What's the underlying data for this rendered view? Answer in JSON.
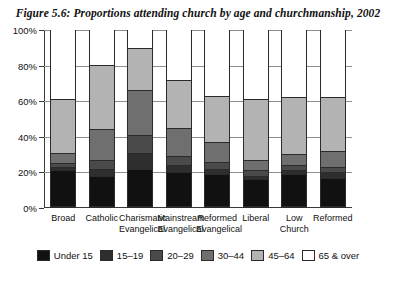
{
  "figure": {
    "title": "Figure 5.6: Proportions attending church by age and churchmanship, 2002"
  },
  "chart_data": {
    "type": "bar",
    "subtype": "stacked-bar",
    "title": "Figure 5.6: Proportions attending church by age and churchmanship, 2002",
    "xlabel": "",
    "ylabel": "",
    "ylim": [
      0,
      100
    ],
    "yticks": [
      "0%",
      "20%",
      "40%",
      "60%",
      "80%",
      "100%"
    ],
    "ytick_values": [
      0,
      20,
      40,
      60,
      80,
      100
    ],
    "grid": true,
    "legend_position": "bottom",
    "categories": [
      "Broad",
      "Catholic",
      "Charismatic Evangelical",
      "Mainstream Evangelical",
      "Reformed Evangelical",
      "Liberal",
      "Low Church",
      "Reformed"
    ],
    "series": [
      {
        "name": "Under 15",
        "color": "#111111",
        "values": [
          20,
          17,
          21,
          19,
          18,
          15,
          18,
          16
        ]
      },
      {
        "name": "15-19",
        "color": "#2e2e2e",
        "values": [
          2,
          4,
          9,
          4,
          3,
          2,
          2,
          3
        ]
      },
      {
        "name": "20-29",
        "color": "#4a4a4a",
        "values": [
          2,
          5,
          10,
          5,
          4,
          3,
          3,
          3
        ]
      },
      {
        "name": "30-44",
        "color": "#6f6f6f",
        "values": [
          6,
          17,
          25,
          16,
          11,
          6,
          6,
          9
        ]
      },
      {
        "name": "45-64",
        "color": "#b3b3b3",
        "values": [
          30,
          36,
          24,
          27,
          26,
          34,
          32,
          30
        ]
      },
      {
        "name": "65 & over",
        "color": "#ffffff",
        "values": [
          40,
          21,
          11,
          29,
          38,
          40,
          39,
          39
        ]
      }
    ],
    "series_totals_excluding_last": [
      60,
      79,
      89,
      71,
      62,
      60,
      61,
      61
    ]
  },
  "legend": {
    "items": [
      {
        "label": "Under 15",
        "color": "#111111"
      },
      {
        "label": "15–19",
        "color": "#2e2e2e"
      },
      {
        "label": "20–29",
        "color": "#4a4a4a"
      },
      {
        "label": "30–44",
        "color": "#6f6f6f"
      },
      {
        "label": "45–64",
        "color": "#b3b3b3"
      },
      {
        "label": "65 & over",
        "color": "#ffffff"
      }
    ]
  }
}
